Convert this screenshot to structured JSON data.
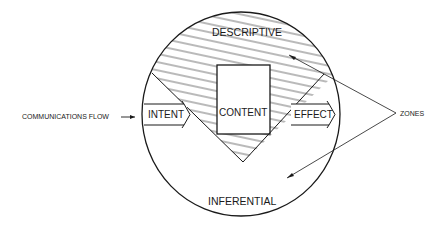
{
  "diagram": {
    "zones": {
      "top": "DESCRIPTIVE",
      "center": "CONTENT",
      "bottom": "INFERENTIAL"
    },
    "arrows": {
      "left": "INTENT",
      "right": "EFFECT"
    },
    "annotations": {
      "flow": "COMMUNICATIONS FLOW",
      "zones_callout": "ZONES"
    },
    "colors": {
      "stroke": "#1a1a1a",
      "background": "#ffffff"
    }
  }
}
